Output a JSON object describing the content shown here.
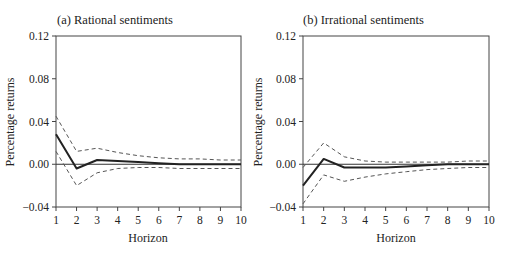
{
  "chart_data": [
    {
      "type": "line",
      "title": "(a) Rational sentiments",
      "xlabel": "Horizon",
      "ylabel": "Percentage returns",
      "x": [
        1,
        2,
        3,
        4,
        5,
        6,
        7,
        8,
        9,
        10
      ],
      "xticks": [
        "1",
        "2",
        "3",
        "4",
        "5",
        "6",
        "7",
        "8",
        "9",
        "10"
      ],
      "yticks": [
        "0.12",
        "0.08",
        "0.04",
        "0.00",
        "-0.04"
      ],
      "ylim": [
        -0.04,
        0.12
      ],
      "xlim": [
        1,
        10
      ],
      "grid": false,
      "zero_line": true,
      "series": [
        {
          "name": "Impulse response",
          "style": "solid",
          "values": [
            0.028,
            -0.004,
            0.004,
            0.003,
            0.002,
            0.001,
            0.0,
            0.0,
            0.0,
            0.0
          ]
        },
        {
          "name": "Upper confidence band",
          "style": "dashed",
          "values": [
            0.045,
            0.012,
            0.015,
            0.011,
            0.008,
            0.006,
            0.005,
            0.005,
            0.004,
            0.004
          ]
        },
        {
          "name": "Lower confidence band",
          "style": "dashed",
          "values": [
            0.012,
            -0.02,
            -0.008,
            -0.004,
            -0.003,
            -0.003,
            -0.004,
            -0.004,
            -0.004,
            -0.004
          ]
        }
      ]
    },
    {
      "type": "line",
      "title": "(b) Irrational sentiments",
      "xlabel": "Horizon",
      "ylabel": "Percentage returns",
      "x": [
        1,
        2,
        3,
        4,
        5,
        6,
        7,
        8,
        9,
        10
      ],
      "xticks": [
        "1",
        "2",
        "3",
        "4",
        "5",
        "6",
        "7",
        "8",
        "9",
        "10"
      ],
      "yticks": [
        "0.12",
        "0.08",
        "0.04",
        "0.00",
        "-0.04"
      ],
      "ylim": [
        -0.04,
        0.12
      ],
      "xlim": [
        1,
        10
      ],
      "grid": false,
      "zero_line": true,
      "series": [
        {
          "name": "Impulse response",
          "style": "solid",
          "values": [
            -0.02,
            0.005,
            -0.003,
            -0.003,
            -0.003,
            -0.002,
            -0.001,
            0.0,
            0.0,
            0.0
          ]
        },
        {
          "name": "Upper confidence band",
          "style": "dashed",
          "values": [
            -0.003,
            0.02,
            0.007,
            0.003,
            0.002,
            0.002,
            0.002,
            0.002,
            0.003,
            0.003
          ]
        },
        {
          "name": "Lower confidence band",
          "style": "dashed",
          "values": [
            -0.037,
            -0.01,
            -0.016,
            -0.012,
            -0.009,
            -0.007,
            -0.005,
            -0.004,
            -0.003,
            -0.003
          ]
        }
      ]
    }
  ],
  "panels": [
    {
      "title": "(a) Rational sentiments",
      "xlabel": "Horizon",
      "ylabel": "Percentage returns"
    },
    {
      "title": "(b) Irrational sentiments",
      "xlabel": "Horizon",
      "ylabel": "Percentage returns"
    }
  ],
  "colors": {
    "line": "#222222",
    "band": "#555555",
    "axis": "#444444",
    "zero": "#333333"
  }
}
